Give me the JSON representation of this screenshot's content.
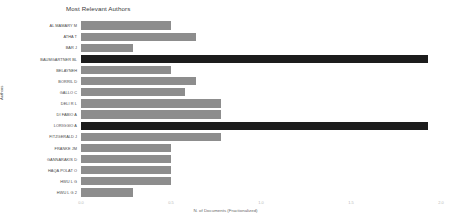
{
  "chart_data": {
    "type": "bar",
    "orientation": "horizontal",
    "title": "Most Relevant Authors",
    "xlabel": "N. of Documents (Fractionalized)",
    "ylabel": "Authors",
    "xlim": [
      0.0,
      2.0
    ],
    "xticks": [
      "0.0",
      "0.5",
      "1.0",
      "1.5",
      "2.0"
    ],
    "xtick_values": [
      0.0,
      0.5,
      1.0,
      1.5,
      2.0
    ],
    "grid": true,
    "legend": "none",
    "bar_color": "#8d8d8d",
    "highlight_color": "#1c1c1c",
    "categories": [
      "AL MAMARY M",
      "ATHA T",
      "BAR J",
      "BAUMGARTNER BL",
      "BELAYNEH",
      "BORRIL D",
      "GALLO C",
      "DELI R L",
      "DI FABIO A",
      "LORIGGIO A",
      "FITZGERALD J",
      "FRANKE JM",
      "GANNARAKIS D",
      "HAQA POLAT O",
      "HWU L G"
    ],
    "values": [
      0.5,
      0.64,
      0.29,
      1.93,
      0.5,
      0.64,
      0.58,
      0.78,
      0.78,
      0.5,
      0.5,
      1.93,
      0.78,
      0.5,
      0.5
    ],
    "series_labels": [
      "AL MAMARY M",
      "ATHA T",
      "BAR J",
      "BAUMGARTNER BL",
      "BELAYNEH",
      "BORRIL D",
      "GALLO C",
      "DELI R L",
      "DI FABIO A",
      "LORIGGIO A",
      "FITZGERALD J",
      "FRANKE JM",
      "GANNARAKIS D",
      "HAQA POLAT O",
      "HWU L G"
    ]
  },
  "bars": [
    {
      "label": "AL MAMARY M",
      "value": 0.5,
      "highlight": false
    },
    {
      "label": "ATHA T",
      "value": 0.64,
      "highlight": false
    },
    {
      "label": "BAR J",
      "value": 0.29,
      "highlight": false
    },
    {
      "label": "BAUMGARTNER BL",
      "value": 1.93,
      "highlight": true
    },
    {
      "label": "BELAYNEH",
      "value": 0.5,
      "highlight": false
    },
    {
      "label": "BORRIL D",
      "value": 0.64,
      "highlight": false
    },
    {
      "label": "GALLO C",
      "value": 0.58,
      "highlight": false
    },
    {
      "label": "DELI R L",
      "value": 0.78,
      "highlight": false
    },
    {
      "label": "DI FABIO A",
      "value": 0.78,
      "highlight": false
    },
    {
      "label": "LORIGGIO A",
      "value": 1.93,
      "highlight": true
    },
    {
      "label": "FITZGERALD J",
      "value": 0.78,
      "highlight": false
    },
    {
      "label": "FRANKE JM",
      "value": 0.5,
      "highlight": false
    },
    {
      "label": "GANNARAKIS D",
      "value": 0.5,
      "highlight": false
    },
    {
      "label": "HAQA POLAT O",
      "value": 0.5,
      "highlight": false
    },
    {
      "label": "HWU L G",
      "value": 0.5,
      "highlight": false
    },
    {
      "label": "HWU L G 2",
      "value": 0.29,
      "highlight": false
    }
  ],
  "axis": {
    "x_title": "N. of Documents (Fractionalized)",
    "y_title": "Authors",
    "ticks": [
      "0.0",
      "0.5",
      "1.0",
      "1.5",
      "2.0"
    ]
  },
  "title": "Most Relevant Authors"
}
